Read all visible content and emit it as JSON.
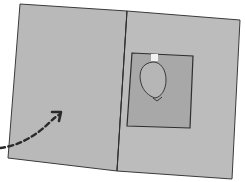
{
  "illustration": {
    "subject": "folded card with balloon-shaped cutout window and dashed arrow",
    "colors": {
      "background": "#ffffff",
      "card_fill": "#b9b9b9",
      "card_outline": "#3a3a3a",
      "window_fill": "#a9a9a9",
      "balloon_fill": "#b4b4b4",
      "tab_fill": "#f2f2f2",
      "arrow": "#2a2a2a"
    },
    "icons": [
      "balloon-icon",
      "dashed-arrow-icon"
    ]
  }
}
